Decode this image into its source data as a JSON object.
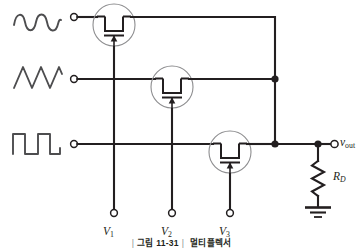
{
  "figure": {
    "caption_prefix": "|",
    "caption_number": "그림 11-31",
    "caption_separator": "|",
    "caption_title": "멀티플렉서"
  },
  "colors": {
    "wire": "#231f20",
    "device_outline": "#8d8d8f",
    "waveform": "#4d4d4f",
    "background": "#ffffff"
  },
  "inputs": [
    {
      "id": "in1",
      "waveform": "sine-wave",
      "terminal_name": "input-terminal-1",
      "row_y": 17
    },
    {
      "id": "in2",
      "waveform": "triangle-wave",
      "terminal_name": "input-terminal-2",
      "row_y": 79
    },
    {
      "id": "in3",
      "waveform": "square-wave",
      "terminal_name": "input-terminal-3",
      "row_y": 144
    }
  ],
  "transistors": [
    {
      "id": "m1",
      "type": "n-channel-mosfet",
      "gate_label_main": "V",
      "gate_label_sub": "1",
      "cx": 114,
      "cy": 25
    },
    {
      "id": "m2",
      "type": "n-channel-mosfet",
      "gate_label_main": "V",
      "gate_label_sub": "2",
      "cx": 172,
      "cy": 87
    },
    {
      "id": "m3",
      "type": "n-channel-mosfet",
      "gate_label_main": "V",
      "gate_label_sub": "3",
      "cx": 230,
      "cy": 152
    }
  ],
  "output": {
    "label_main": "v",
    "label_sub": "out",
    "terminal_name": "output-terminal"
  },
  "resistor": {
    "label_main": "R",
    "label_sub": "D",
    "component": "drain-resistor"
  },
  "ground": {
    "symbol": "ground-symbol"
  }
}
